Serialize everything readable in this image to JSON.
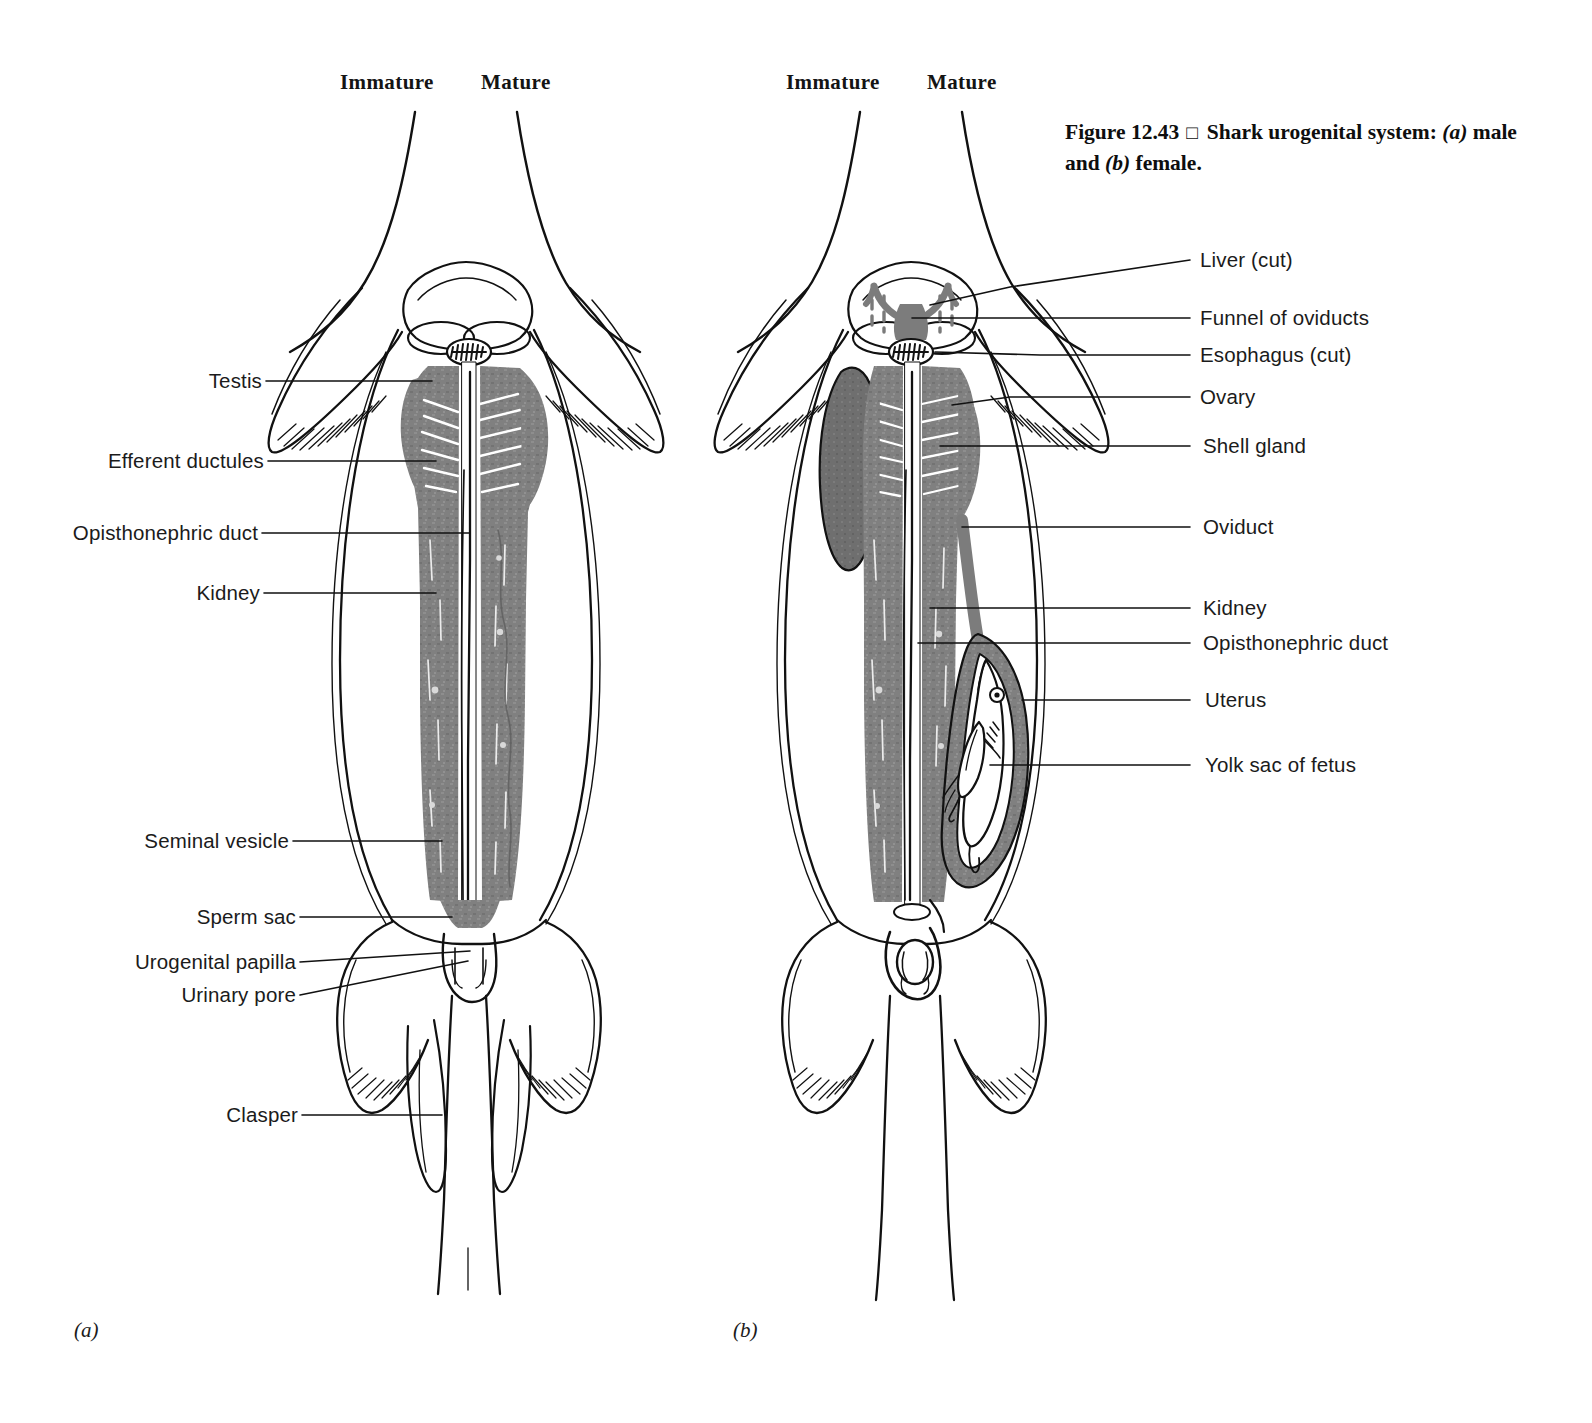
{
  "figure": {
    "number": "Figure 12.43",
    "marker": "□",
    "title_part1": "Shark urogenital system: ",
    "title_a": "(a)",
    "title_part2": " male and ",
    "title_b": "(b)",
    "title_part3": " female."
  },
  "panels": [
    {
      "id": "(a)",
      "sex": "male"
    },
    {
      "id": "(b)",
      "sex": "female"
    }
  ],
  "column_headers": {
    "male_immature": "Immature",
    "male_mature": "Mature",
    "female_immature": "Immature",
    "female_mature": "Mature"
  },
  "male_labels": [
    {
      "text": "Testis"
    },
    {
      "text": "Efferent ductules"
    },
    {
      "text": "Opisthonephric duct"
    },
    {
      "text": "Kidney"
    },
    {
      "text": "Seminal vesicle"
    },
    {
      "text": "Sperm sac"
    },
    {
      "text": "Urogenital papilla"
    },
    {
      "text": "Urinary pore"
    },
    {
      "text": "Clasper"
    }
  ],
  "female_labels": [
    {
      "text": "Liver (cut)"
    },
    {
      "text": "Funnel of oviducts"
    },
    {
      "text": "Esophagus (cut)"
    },
    {
      "text": "Ovary"
    },
    {
      "text": "Shell gland"
    },
    {
      "text": "Oviduct"
    },
    {
      "text": "Kidney"
    },
    {
      "text": "Opisthonephric duct"
    },
    {
      "text": "Uterus"
    },
    {
      "text": "Yolk sac of fetus"
    }
  ],
  "colors": {
    "background": "#ffffff",
    "ink": "#111111",
    "organ_gray": "#808080",
    "organ_gray_dark": "#6e6e6e"
  }
}
